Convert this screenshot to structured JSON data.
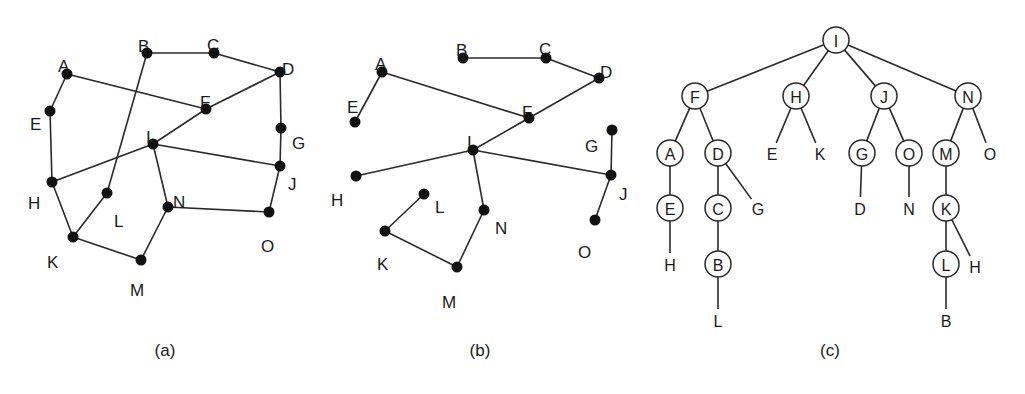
{
  "colors": {
    "ink": "#1a1a1a",
    "background": "#ffffff"
  },
  "panels": [
    {
      "id": "a",
      "caption": "(a)",
      "caption_pos": [
        165,
        356
      ],
      "nodes": [
        {
          "id": "A",
          "x": 67,
          "y": 74,
          "lx": 58,
          "ly": 60
        },
        {
          "id": "B",
          "x": 147,
          "y": 53,
          "lx": 138,
          "ly": 40
        },
        {
          "id": "C",
          "x": 214,
          "y": 53,
          "lx": 207,
          "ly": 39
        },
        {
          "id": "D",
          "x": 280,
          "y": 72,
          "lx": 282,
          "ly": 63
        },
        {
          "id": "E",
          "x": 50,
          "y": 111,
          "lx": 30,
          "ly": 118
        },
        {
          "id": "F",
          "x": 206,
          "y": 109,
          "lx": 200,
          "ly": 96
        },
        {
          "id": "G",
          "x": 281,
          "y": 128,
          "lx": 292,
          "ly": 137
        },
        {
          "id": "H",
          "x": 52,
          "y": 182,
          "lx": 28,
          "ly": 197
        },
        {
          "id": "I",
          "x": 153,
          "y": 144,
          "lx": 146,
          "ly": 131
        },
        {
          "id": "J",
          "x": 280,
          "y": 166,
          "lx": 288,
          "ly": 178
        },
        {
          "id": "K",
          "x": 73,
          "y": 237,
          "lx": 47,
          "ly": 256
        },
        {
          "id": "L",
          "x": 107,
          "y": 193,
          "lx": 114,
          "ly": 215
        },
        {
          "id": "M",
          "x": 141,
          "y": 260,
          "lx": 130,
          "ly": 284
        },
        {
          "id": "N",
          "x": 168,
          "y": 207,
          "lx": 173,
          "ly": 196
        },
        {
          "id": "O",
          "x": 269,
          "y": 212,
          "lx": 261,
          "ly": 240
        }
      ],
      "edges": [
        [
          "A",
          "E"
        ],
        [
          "A",
          "F"
        ],
        [
          "B",
          "C"
        ],
        [
          "B",
          "L"
        ],
        [
          "C",
          "D"
        ],
        [
          "D",
          "F"
        ],
        [
          "D",
          "G"
        ],
        [
          "E",
          "H"
        ],
        [
          "F",
          "I"
        ],
        [
          "G",
          "J"
        ],
        [
          "H",
          "I"
        ],
        [
          "H",
          "K"
        ],
        [
          "I",
          "J"
        ],
        [
          "I",
          "N"
        ],
        [
          "J",
          "O"
        ],
        [
          "K",
          "L"
        ],
        [
          "K",
          "M"
        ],
        [
          "M",
          "N"
        ],
        [
          "N",
          "O"
        ]
      ]
    },
    {
      "id": "b",
      "caption": "(b)",
      "caption_pos": [
        480,
        356
      ],
      "nodes": [
        {
          "id": "A",
          "x": 382,
          "y": 72,
          "lx": 375,
          "ly": 58
        },
        {
          "id": "B",
          "x": 463,
          "y": 58,
          "lx": 456,
          "ly": 44
        },
        {
          "id": "C",
          "x": 546,
          "y": 58,
          "lx": 539,
          "ly": 43
        },
        {
          "id": "D",
          "x": 599,
          "y": 78,
          "lx": 600,
          "ly": 66
        },
        {
          "id": "E",
          "x": 355,
          "y": 122,
          "lx": 347,
          "ly": 101
        },
        {
          "id": "F",
          "x": 529,
          "y": 118,
          "lx": 522,
          "ly": 106
        },
        {
          "id": "G",
          "x": 612,
          "y": 130,
          "lx": 585,
          "ly": 140
        },
        {
          "id": "H",
          "x": 356,
          "y": 176,
          "lx": 331,
          "ly": 194
        },
        {
          "id": "I",
          "x": 473,
          "y": 150,
          "lx": 467,
          "ly": 136
        },
        {
          "id": "J",
          "x": 611,
          "y": 175,
          "lx": 619,
          "ly": 188
        },
        {
          "id": "K",
          "x": 385,
          "y": 231,
          "lx": 377,
          "ly": 258
        },
        {
          "id": "L",
          "x": 424,
          "y": 194,
          "lx": 435,
          "ly": 201
        },
        {
          "id": "M",
          "x": 457,
          "y": 267,
          "lx": 442,
          "ly": 296
        },
        {
          "id": "N",
          "x": 484,
          "y": 210,
          "lx": 495,
          "ly": 222
        },
        {
          "id": "O",
          "x": 595,
          "y": 220,
          "lx": 578,
          "ly": 246
        }
      ],
      "edges": [
        [
          "A",
          "E"
        ],
        [
          "A",
          "F"
        ],
        [
          "B",
          "C"
        ],
        [
          "C",
          "D"
        ],
        [
          "D",
          "F"
        ],
        [
          "F",
          "I"
        ],
        [
          "H",
          "I"
        ],
        [
          "I",
          "J"
        ],
        [
          "I",
          "N"
        ],
        [
          "G",
          "J"
        ],
        [
          "J",
          "O"
        ],
        [
          "K",
          "L"
        ],
        [
          "K",
          "M"
        ],
        [
          "M",
          "N"
        ]
      ]
    },
    {
      "id": "c",
      "caption": "(c)",
      "caption_pos": [
        830,
        356
      ],
      "radius": 13,
      "nodes": [
        {
          "key": "I",
          "label": "I",
          "x": 836,
          "y": 40,
          "circled": true
        },
        {
          "key": "F",
          "label": "F",
          "x": 695,
          "y": 96,
          "circled": true
        },
        {
          "key": "H",
          "label": "H",
          "x": 796,
          "y": 96,
          "circled": true
        },
        {
          "key": "J",
          "label": "J",
          "x": 884,
          "y": 96,
          "circled": true
        },
        {
          "key": "N",
          "label": "N",
          "x": 968,
          "y": 96,
          "circled": true
        },
        {
          "key": "A",
          "label": "A",
          "x": 670,
          "y": 153,
          "circled": true
        },
        {
          "key": "D",
          "label": "D",
          "x": 718,
          "y": 153,
          "circled": true
        },
        {
          "key": "E1",
          "label": "E",
          "x": 772,
          "y": 153,
          "circled": false
        },
        {
          "key": "K1",
          "label": "K",
          "x": 820,
          "y": 153,
          "circled": false
        },
        {
          "key": "G",
          "label": "G",
          "x": 862,
          "y": 153,
          "circled": true
        },
        {
          "key": "O",
          "label": "O",
          "x": 909,
          "y": 153,
          "circled": true
        },
        {
          "key": "M",
          "label": "M",
          "x": 946,
          "y": 153,
          "circled": true
        },
        {
          "key": "O1",
          "label": "O",
          "x": 990,
          "y": 153,
          "circled": false
        },
        {
          "key": "E",
          "label": "E",
          "x": 670,
          "y": 208,
          "circled": true
        },
        {
          "key": "C",
          "label": "C",
          "x": 718,
          "y": 208,
          "circled": true
        },
        {
          "key": "G1",
          "label": "G",
          "x": 758,
          "y": 208,
          "circled": false
        },
        {
          "key": "D1",
          "label": "D",
          "x": 860,
          "y": 208,
          "circled": false
        },
        {
          "key": "N1",
          "label": "N",
          "x": 909,
          "y": 208,
          "circled": false
        },
        {
          "key": "K",
          "label": "K",
          "x": 946,
          "y": 208,
          "circled": true
        },
        {
          "key": "H1",
          "label": "H",
          "x": 670,
          "y": 264,
          "circled": false
        },
        {
          "key": "B",
          "label": "B",
          "x": 718,
          "y": 264,
          "circled": true
        },
        {
          "key": "L",
          "label": "L",
          "x": 946,
          "y": 264,
          "circled": true
        },
        {
          "key": "H2",
          "label": "H",
          "x": 975,
          "y": 266,
          "circled": false
        },
        {
          "key": "L1",
          "label": "L",
          "x": 718,
          "y": 320,
          "circled": false
        },
        {
          "key": "B1",
          "label": "B",
          "x": 946,
          "y": 320,
          "circled": false
        }
      ],
      "edges": [
        [
          "I",
          "F"
        ],
        [
          "I",
          "H"
        ],
        [
          "I",
          "J"
        ],
        [
          "I",
          "N"
        ],
        [
          "F",
          "A"
        ],
        [
          "F",
          "D"
        ],
        [
          "H",
          "E1"
        ],
        [
          "H",
          "K1"
        ],
        [
          "J",
          "G"
        ],
        [
          "J",
          "O"
        ],
        [
          "N",
          "M"
        ],
        [
          "N",
          "O1"
        ],
        [
          "A",
          "E"
        ],
        [
          "D",
          "C"
        ],
        [
          "D",
          "G1"
        ],
        [
          "G",
          "D1"
        ],
        [
          "O",
          "N1"
        ],
        [
          "M",
          "K"
        ],
        [
          "E",
          "H1"
        ],
        [
          "C",
          "B"
        ],
        [
          "K",
          "L"
        ],
        [
          "K",
          "H2"
        ],
        [
          "B",
          "L1"
        ],
        [
          "L",
          "B1"
        ]
      ]
    }
  ]
}
